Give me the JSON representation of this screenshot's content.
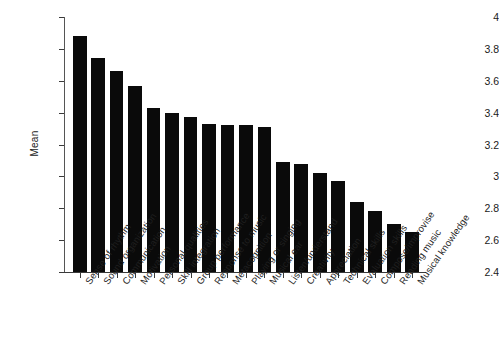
{
  "chart_data": {
    "type": "bar",
    "title": "",
    "xlabel": "",
    "ylabel": "Mean",
    "ylim": [
      2.4,
      4
    ],
    "ytick_step": 0.2,
    "grid": false,
    "legend": "none",
    "bar_color": "#0a0a0a",
    "yticks": [
      "4",
      "3.8",
      "3.6",
      "3.4",
      "3.2",
      "3",
      "2.8",
      "2.6",
      "2.4"
    ],
    "ytick_values": [
      4,
      3.8,
      3.6,
      3.4,
      3.2,
      3,
      2.8,
      2.6,
      2.4
    ],
    "categories": [
      "Sense of rhythm",
      "Sound organization",
      "Communication",
      "Motivation",
      "Personal qualities",
      "Skill integration",
      "Group performance",
      "Response to music",
      "Metacognition",
      "Playing or singing",
      "Musical ear",
      "Listen/understand",
      "Creativity",
      "Appreciation",
      "Technical skills",
      "Evaluation skills",
      "Compose/improvise",
      "Reading music",
      "Musical knowledge"
    ],
    "values": [
      3.88,
      3.74,
      3.66,
      3.57,
      3.43,
      3.4,
      3.37,
      3.33,
      3.32,
      3.32,
      3.31,
      3.09,
      3.08,
      3.02,
      2.97,
      2.84,
      2.78,
      2.7,
      2.65
    ]
  }
}
